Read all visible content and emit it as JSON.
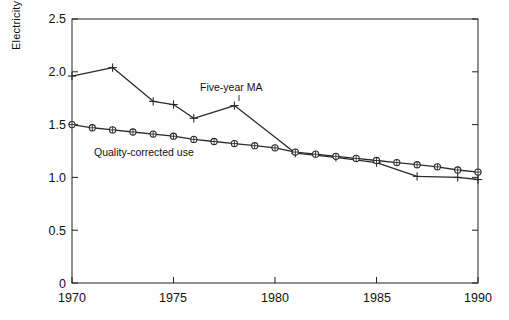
{
  "chart_data": {
    "type": "line",
    "title": "",
    "xlabel": "",
    "ylabel": "Electricity use (kWh/day)",
    "xlim": [
      1970,
      1990
    ],
    "ylim": [
      0,
      2.5
    ],
    "xticks": [
      1970,
      1975,
      1980,
      1985,
      1990
    ],
    "xtick_labels": [
      "1970",
      "1975",
      "1980",
      "1985",
      "1990"
    ],
    "yticks": [
      0,
      0.5,
      1.0,
      1.5,
      2.0,
      2.5
    ],
    "ytick_labels": [
      "0",
      "0.5",
      "1.0",
      "1.5",
      "2.0",
      "2.5"
    ],
    "grid": false,
    "legend_position": "inline-annotation",
    "series": [
      {
        "name": "Five-year MA",
        "marker": "plus",
        "label_text": "Five-year MA",
        "label_x": 1978.0,
        "label_y": 1.86,
        "x": [
          1970,
          1972,
          1974,
          1975,
          1976,
          1978,
          1981,
          1983,
          1985,
          1987,
          1989,
          1990
        ],
        "values": [
          1.96,
          2.04,
          1.72,
          1.69,
          1.56,
          1.68,
          1.23,
          1.19,
          1.14,
          1.01,
          1.0,
          0.98
        ]
      },
      {
        "name": "Quality-corrected use",
        "marker": "circle-cross",
        "label_text": "Quality-corrected use",
        "label_x": 1974.2,
        "label_y": 1.17,
        "x": [
          1970,
          1971,
          1972,
          1973,
          1974,
          1975,
          1976,
          1977,
          1978,
          1979,
          1980,
          1981,
          1982,
          1983,
          1984,
          1985,
          1986,
          1987,
          1988,
          1989,
          1990
        ],
        "values": [
          1.5,
          1.47,
          1.45,
          1.43,
          1.41,
          1.39,
          1.36,
          1.34,
          1.32,
          1.3,
          1.28,
          1.24,
          1.22,
          1.2,
          1.18,
          1.16,
          1.14,
          1.12,
          1.1,
          1.07,
          1.05
        ]
      }
    ],
    "colors": {
      "axis": "#222222",
      "series_1": "#2b2b2b",
      "series_2": "#2b2b2b",
      "background": "#ffffff"
    }
  }
}
